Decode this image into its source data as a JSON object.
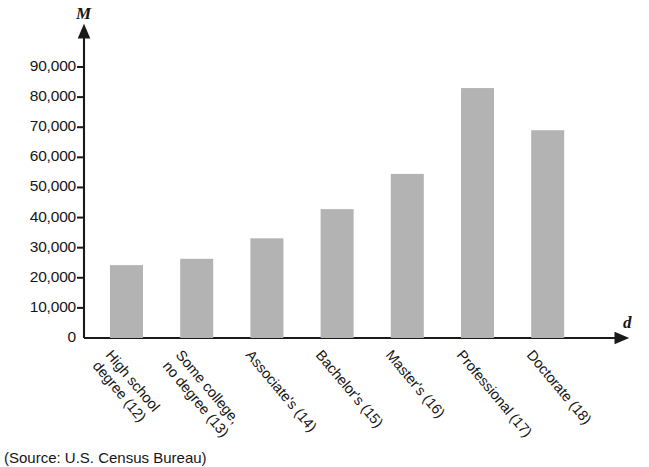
{
  "chart_data": {
    "type": "bar",
    "title": "",
    "subtitle": "",
    "xlabel": "d",
    "ylabel": "M",
    "categories": [
      "High school degree (12)",
      "Some college, no degree (13)",
      "Associate's (14)",
      "Bachelor's (15)",
      "Master's (16)",
      "Professional (17)",
      "Doctorate (18)"
    ],
    "category_lines": [
      [
        "High school",
        "degree (12)"
      ],
      [
        "Some college,",
        "no degree (13)"
      ],
      [
        "Associate's (14)"
      ],
      [
        "Bachelor's (15)"
      ],
      [
        "Master's (16)"
      ],
      [
        "Professional (17)"
      ],
      [
        "Doctorate (18)"
      ]
    ],
    "values": [
      24200,
      26300,
      33100,
      42800,
      54500,
      83000,
      69000
    ],
    "ylim": [
      0,
      95000
    ],
    "ytick_values": [
      0,
      10000,
      20000,
      30000,
      40000,
      50000,
      60000,
      70000,
      80000,
      90000
    ],
    "ytick_labels": [
      "0",
      "10,000",
      "20,000",
      "30,000",
      "40,000",
      "50,000",
      "60,000",
      "70,000",
      "80,000",
      "90,000"
    ],
    "grid": false,
    "legend": "none",
    "bar_color": "#b3b3b3",
    "axis_color": "#1a1a1a"
  },
  "caption": {
    "source": "(Source: U.S. Census Bureau)"
  }
}
